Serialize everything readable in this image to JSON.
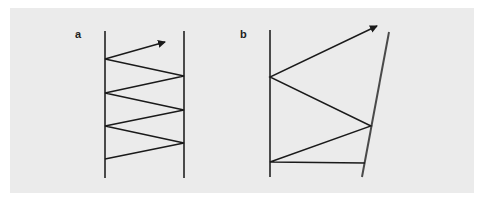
{
  "figure": {
    "background": "#ebebeb",
    "line_color": "#4a4a4a",
    "ray_color": "#1a1a1a",
    "panels": [
      {
        "label": "a",
        "description": "Parallel mirrors: ray zigzags between two vertical parallel lines and exits upward",
        "left_wall": {
          "x": 105,
          "y1": 31,
          "y2": 178
        },
        "right_wall": {
          "x1": 184,
          "y1": 31,
          "x2": 184,
          "y2": 178
        },
        "ray_points": [
          [
            105,
            159
          ],
          [
            184,
            143
          ],
          [
            105,
            126
          ],
          [
            184,
            110
          ],
          [
            105,
            93
          ],
          [
            184,
            76
          ],
          [
            105,
            59
          ],
          [
            165,
            42
          ]
        ]
      },
      {
        "label": "b",
        "description": "Non-parallel mirrors: ray bounces between a vertical line and a tilted line, angle grows, exits upward",
        "left_wall": {
          "x": 270,
          "y1": 30,
          "y2": 177
        },
        "right_wall": {
          "x1": 389,
          "y1": 32,
          "x2": 362,
          "y2": 177
        },
        "ray_points": [
          [
            365,
            163
          ],
          [
            270,
            162
          ],
          [
            371,
            126
          ],
          [
            270,
            77
          ],
          [
            377,
            26
          ]
        ]
      }
    ]
  }
}
